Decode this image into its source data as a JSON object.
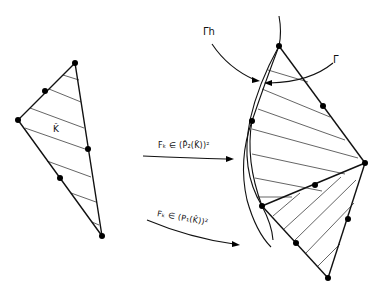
{
  "figure": {
    "reference_element": {
      "label": "K̂",
      "vertices": [
        [
          75,
          63
        ],
        [
          18,
          120
        ],
        [
          102,
          236
        ]
      ],
      "midpoints": [
        [
          45,
          91
        ],
        [
          88,
          149
        ],
        [
          60,
          178
        ]
      ]
    },
    "mapped_element": {
      "vertices": [
        [
          279,
          46
        ],
        [
          252,
          121
        ],
        [
          365,
          163
        ],
        [
          262,
          206
        ],
        [
          328,
          278
        ]
      ],
      "nodes": [
        [
          279,
          46
        ],
        [
          323,
          106
        ],
        [
          252,
          121
        ],
        [
          365,
          163
        ],
        [
          315,
          185
        ],
        [
          262,
          206
        ],
        [
          348,
          219
        ],
        [
          296,
          243
        ],
        [
          328,
          278
        ]
      ]
    },
    "boundary_labels": {
      "gamma_h": "Γh",
      "gamma": "Γ"
    },
    "mappings": [
      {
        "id": "quadratic",
        "text": "Fₖ ∈ (P̂₂(K̂))²"
      },
      {
        "id": "linear",
        "text": "Fₖ ∈ (P₁(K̂))²"
      }
    ]
  }
}
